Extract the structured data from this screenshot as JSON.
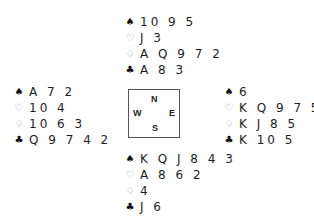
{
  "diagram": {
    "type": "bridge-deal",
    "compass": {
      "north": "N",
      "west": "W",
      "east": "E",
      "south": "S"
    },
    "suits": {
      "spades": "♠",
      "hearts": "♡",
      "diamonds": "♢",
      "clubs": "♣"
    },
    "hands": {
      "north": {
        "spades": "10 9 5",
        "hearts": "J 3",
        "diamonds": "A Q 9 7 2",
        "clubs": "A 8 3"
      },
      "west": {
        "spades": "A 7 2",
        "hearts": "10 4",
        "diamonds": "10 6 3",
        "clubs": "Q 9 7 4 2"
      },
      "east": {
        "spades": "6",
        "hearts": "K Q 9 7 5",
        "diamonds": "K J 8 5",
        "clubs": "K 10 5"
      },
      "south": {
        "spades": "K Q J 8 4 3",
        "hearts": "A 8 6 2",
        "diamonds": "4",
        "clubs": "J 6"
      }
    }
  }
}
